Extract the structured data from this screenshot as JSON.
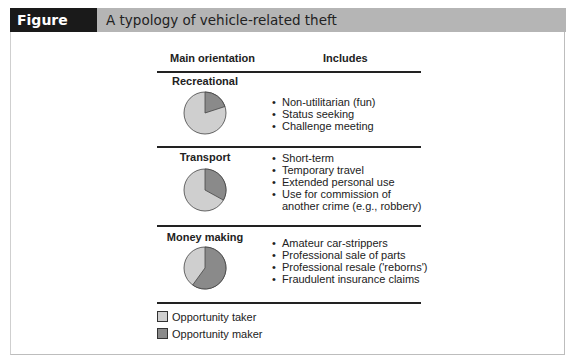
{
  "figure": {
    "label": "Figure 20.16",
    "title": "A typology of vehicle-related theft"
  },
  "table": {
    "headers": [
      "Main orientation",
      "Includes"
    ],
    "rows": [
      {
        "orientation": "Recreational",
        "maker_pct": 20,
        "items": [
          "Non-utilitarian (fun)",
          "Status seeking",
          "Challenge meeting"
        ]
      },
      {
        "orientation": "Transport",
        "maker_pct": 33,
        "items": [
          "Short-term",
          "Temporary travel",
          "Extended personal use",
          "Use for commission of",
          "another crime (e.g., robbery)"
        ]
      },
      {
        "orientation": "Money making",
        "maker_pct": 60,
        "items": [
          "Amateur car-strippers",
          "Professional sale of parts",
          "Professional resale ('reborns')",
          "Fraudulent insurance claims"
        ]
      }
    ]
  },
  "legend": [
    {
      "label": "Opportunity taker",
      "color": "#cfcfcf"
    },
    {
      "label": "Opportunity maker",
      "color": "#8a8a8a"
    }
  ],
  "colors": {
    "taker": "#cfcfcf",
    "maker": "#8a8a8a",
    "titlebar": "#b5b5b5",
    "label_bg": "#1a1a1a"
  }
}
